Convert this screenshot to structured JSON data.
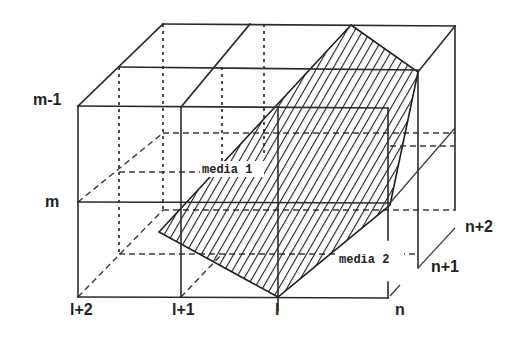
{
  "diagram": {
    "row_labels": [
      "m-1",
      "m"
    ],
    "column_labels": [
      "l+2",
      "l+1",
      "l"
    ],
    "depth_labels": [
      "n",
      "n+1",
      "n+2"
    ],
    "regions": [
      {
        "name": "media 1",
        "label": "media 1"
      },
      {
        "name": "media 2",
        "label": "media 2"
      }
    ],
    "interface": {
      "style": "diagonal-hatch",
      "color": "#222222"
    },
    "colors": {
      "line": "#2a2a2a",
      "background": "#ffffff"
    }
  }
}
